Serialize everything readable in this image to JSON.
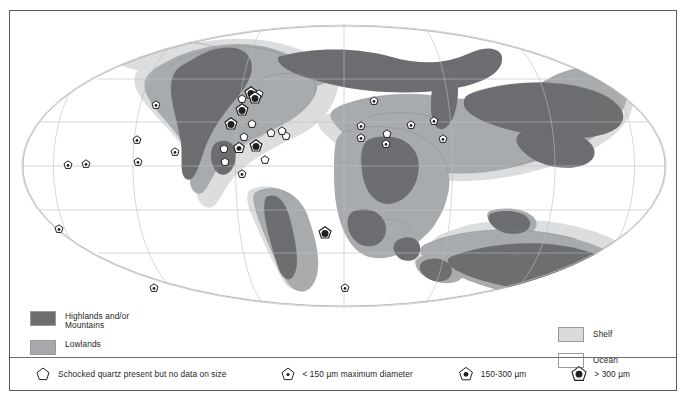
{
  "figure": {
    "kind": "paleogeographic-world-map",
    "projection": "mollweide-like oval",
    "frame_color": "#58595b"
  },
  "area_legend_left": {
    "items": [
      {
        "label": "Highlands and/or\nMountains",
        "color": "#6d6e70",
        "name": "highlands-mountains"
      },
      {
        "label": "Lowlands",
        "color": "#a7a9ac",
        "name": "lowlands"
      }
    ]
  },
  "area_legend_right": {
    "items": [
      {
        "label": "Shelf",
        "color": "#d9dadb",
        "name": "shelf"
      },
      {
        "label": "Ocean",
        "color": "#ffffff",
        "name": "ocean"
      }
    ]
  },
  "symbol_legend": {
    "items": [
      {
        "label": "Schocked quartz present but no data on size",
        "symbol": "pentagon-open",
        "name": "quartz-no-size"
      },
      {
        "label": "< 150 µm maximum diameter",
        "symbol": "pentagon-small-dot",
        "name": "quartz-lt-150"
      },
      {
        "label": "150-300 µm",
        "symbol": "pentagon-medium-dot",
        "name": "quartz-150-300"
      },
      {
        "label": "> 300 µm",
        "symbol": "pentagon-large-dot",
        "name": "quartz-gt-300"
      }
    ]
  },
  "map": {
    "graticule": {
      "latitudes": [
        60,
        30,
        0,
        -30,
        -60
      ],
      "longitude_lines": 9,
      "color": "#bcbec0"
    },
    "markers": [
      {
        "x": 48,
        "y": 144,
        "type": "pentagon-small-dot"
      },
      {
        "x": 66,
        "y": 143,
        "type": "pentagon-small-dot"
      },
      {
        "x": 118,
        "y": 141,
        "type": "pentagon-small-dot"
      },
      {
        "x": 117,
        "y": 119,
        "type": "pentagon-small-dot"
      },
      {
        "x": 155,
        "y": 131,
        "type": "pentagon-small-dot"
      },
      {
        "x": 136,
        "y": 84,
        "type": "pentagon-small-dot"
      },
      {
        "x": 39,
        "y": 208,
        "type": "pentagon-small-dot"
      },
      {
        "x": 134,
        "y": 267,
        "type": "pentagon-small-dot"
      },
      {
        "x": 222,
        "y": 78,
        "type": "pentagon-open"
      },
      {
        "x": 231,
        "y": 72,
        "type": "pentagon-filled"
      },
      {
        "x": 239,
        "y": 73,
        "type": "pentagon-open"
      },
      {
        "x": 235,
        "y": 77,
        "type": "pentagon-filled"
      },
      {
        "x": 222,
        "y": 89,
        "type": "pentagon-filled"
      },
      {
        "x": 211,
        "y": 103,
        "type": "pentagon-filled"
      },
      {
        "x": 232,
        "y": 103,
        "type": "pentagon-open"
      },
      {
        "x": 224,
        "y": 116,
        "type": "pentagon-open"
      },
      {
        "x": 251,
        "y": 112,
        "type": "pentagon-open"
      },
      {
        "x": 266,
        "y": 115,
        "type": "pentagon-open"
      },
      {
        "x": 204,
        "y": 128,
        "type": "pentagon-open"
      },
      {
        "x": 219,
        "y": 127,
        "type": "pentagon-medium-dot"
      },
      {
        "x": 236,
        "y": 125,
        "type": "pentagon-filled"
      },
      {
        "x": 205,
        "y": 141,
        "type": "pentagon-open"
      },
      {
        "x": 222,
        "y": 153,
        "type": "pentagon-small-dot"
      },
      {
        "x": 245,
        "y": 139,
        "type": "pentagon-open"
      },
      {
        "x": 262,
        "y": 110,
        "type": "pentagon-open"
      },
      {
        "x": 305,
        "y": 212,
        "type": "pentagon-filled"
      },
      {
        "x": 325,
        "y": 267,
        "type": "pentagon-small-dot"
      },
      {
        "x": 354,
        "y": 80,
        "type": "pentagon-small-dot"
      },
      {
        "x": 341,
        "y": 105,
        "type": "pentagon-small-dot"
      },
      {
        "x": 341,
        "y": 117,
        "type": "pentagon-small-dot"
      },
      {
        "x": 367,
        "y": 113,
        "type": "pentagon-open"
      },
      {
        "x": 366,
        "y": 123,
        "type": "pentagon-small-dot"
      },
      {
        "x": 391,
        "y": 104,
        "type": "pentagon-small-dot"
      },
      {
        "x": 414,
        "y": 100,
        "type": "pentagon-small-dot"
      },
      {
        "x": 423,
        "y": 118,
        "type": "pentagon-small-dot"
      }
    ]
  }
}
